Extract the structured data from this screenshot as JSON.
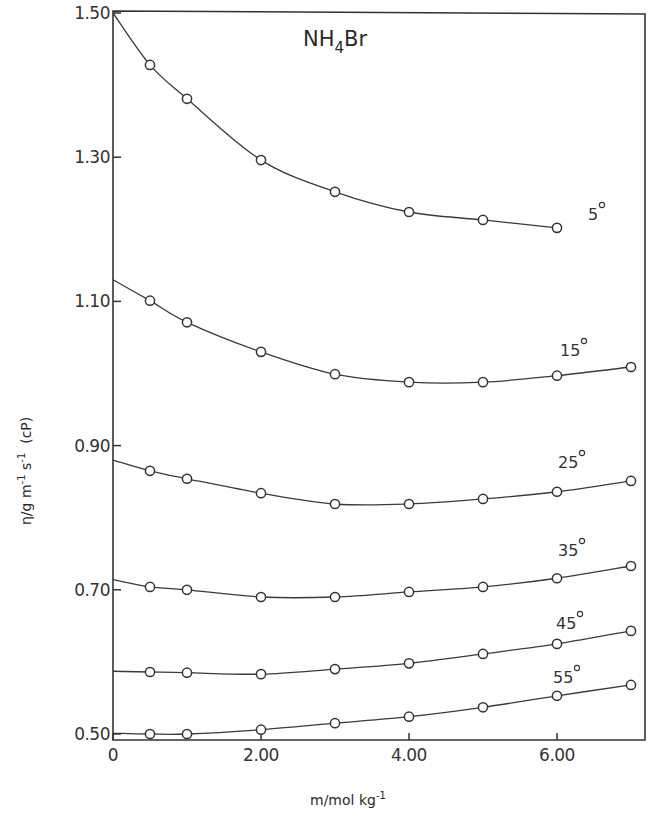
{
  "chart_data": {
    "type": "line",
    "title": "NH4Br",
    "title_parts": {
      "main": "NH",
      "sub": "4",
      "rest": "Br"
    },
    "xlabel": "m/mol kg-1",
    "xlabel_parts": {
      "main": "m/mol kg",
      "sup": "-1"
    },
    "ylabel": "η/g m-1 s-1 (cP)",
    "ylabel_parts": {
      "a": "η/g m",
      "sup1": "-1",
      "b": " s",
      "sup2": "-1",
      "c": "  (cP)"
    },
    "xlim": [
      0,
      7.2
    ],
    "ylim": [
      0.49,
      1.51
    ],
    "x_ticks": [
      0,
      2.0,
      4.0,
      6.0
    ],
    "x_tick_labels": [
      "0",
      "2.00",
      "4.00",
      "6.00"
    ],
    "y_ticks": [
      0.5,
      0.7,
      0.9,
      1.1,
      1.3,
      1.5
    ],
    "y_tick_labels": [
      "0.50",
      "0.70",
      "0.90",
      "1.10",
      "1.30",
      "1.50"
    ],
    "grid": false,
    "legend": "inline labels at right end of each curve",
    "x": [
      0.5,
      1,
      2,
      3,
      4,
      5,
      6,
      7
    ],
    "series": [
      {
        "name": "5°",
        "label": "5",
        "intercept": 1.5,
        "values": [
          1.428,
          1.381,
          1.296,
          1.252,
          1.224,
          1.213,
          1.202,
          null
        ]
      },
      {
        "name": "15°",
        "label": "15",
        "intercept": 1.13,
        "values": [
          1.101,
          1.071,
          1.03,
          0.999,
          0.988,
          0.988,
          0.997,
          1.009
        ]
      },
      {
        "name": "25°",
        "label": "25",
        "intercept": 0.88,
        "values": [
          0.865,
          0.854,
          0.834,
          0.819,
          0.819,
          0.826,
          0.836,
          0.851
        ]
      },
      {
        "name": "35°",
        "label": "35",
        "intercept": 0.714,
        "values": [
          0.704,
          0.7,
          0.69,
          0.69,
          0.697,
          0.704,
          0.716,
          0.733
        ]
      },
      {
        "name": "45°",
        "label": "45",
        "intercept": 0.587,
        "values": [
          0.586,
          0.585,
          0.583,
          0.59,
          0.598,
          0.611,
          0.625,
          0.643
        ]
      },
      {
        "name": "55°",
        "label": "55",
        "intercept": 0.501,
        "values": [
          0.5,
          0.5,
          0.506,
          0.515,
          0.524,
          0.537,
          0.553,
          0.568
        ]
      }
    ]
  }
}
